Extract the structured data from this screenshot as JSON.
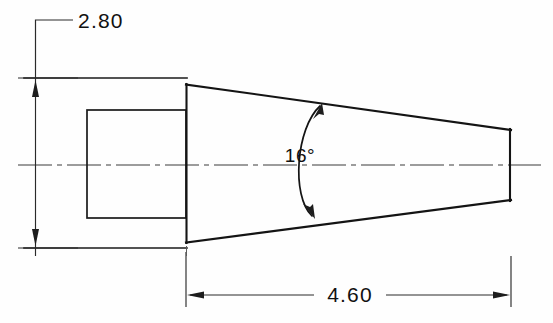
{
  "drawing": {
    "title": "Tapered Shank Engineering Drawing",
    "background_color": "#fefefe",
    "line_color": "#141414",
    "dimension_color": "#2a2a2a",
    "dimensions": {
      "height": {
        "value": "2.80",
        "label": "2.80",
        "orientation": "vertical",
        "placement": "left",
        "leader": true
      },
      "length": {
        "value": "4.60",
        "label": "4.60",
        "orientation": "horizontal",
        "placement": "bottom",
        "leader": false
      }
    },
    "annotations": {
      "taper_angle": {
        "value": "16",
        "label": "16°",
        "symbol": "degree",
        "arc": true,
        "arrowheads": 2
      }
    },
    "features": {
      "hidden_bore": {
        "name": "rectangular-bore",
        "style": "solid"
      },
      "body": {
        "name": "tapered-body",
        "style": "solid"
      },
      "axis": {
        "name": "centerline",
        "style": "dash-dot"
      }
    }
  }
}
